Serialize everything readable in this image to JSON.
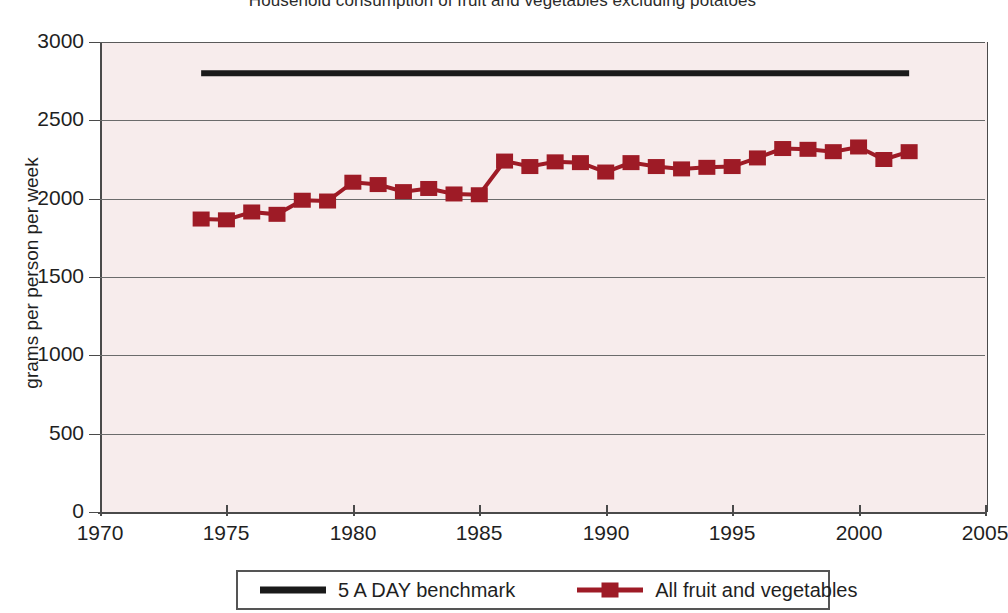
{
  "chart_data": {
    "type": "line",
    "title": "Household consumption of fruit and vegetables excluding potatoes",
    "xlabel": "",
    "ylabel": "grams per person per week",
    "xlim": [
      1970,
      2005
    ],
    "ylim": [
      0,
      3000
    ],
    "xticks": [
      1970,
      1975,
      1980,
      1985,
      1990,
      1995,
      2000,
      2005
    ],
    "xtick_labels": [
      "1970",
      "1975",
      "1980",
      "1985",
      "1990",
      "1995",
      "2000",
      "2005"
    ],
    "yticks": [
      0,
      500,
      1000,
      1500,
      2000,
      2500,
      3000
    ],
    "ytick_labels": [
      "0",
      "500",
      "1000",
      "1500",
      "2000",
      "2500",
      "3000"
    ],
    "grid": "horizontal",
    "legend_position": "bottom",
    "plot_background": "#f7ecec",
    "series": [
      {
        "name": "5 A DAY benchmark",
        "color": "#1a1a1a",
        "marker": "none",
        "line_width": 6,
        "x": [
          1974,
          2002
        ],
        "values": [
          2800,
          2800
        ]
      },
      {
        "name": "All fruit and vegetables",
        "color": "#9e1b26",
        "marker": "square",
        "line_width": 4,
        "x": [
          1974,
          1975,
          1976,
          1977,
          1978,
          1979,
          1980,
          1981,
          1982,
          1983,
          1984,
          1985,
          1986,
          1987,
          1988,
          1989,
          1990,
          1991,
          1992,
          1993,
          1994,
          1995,
          1996,
          1997,
          1998,
          1999,
          2000,
          2001,
          2002
        ],
        "values": [
          1870,
          1865,
          1915,
          1900,
          1990,
          1985,
          2105,
          2090,
          2045,
          2065,
          2030,
          2025,
          2240,
          2205,
          2235,
          2230,
          2170,
          2230,
          2205,
          2190,
          2200,
          2205,
          2260,
          2320,
          2315,
          2300,
          2330,
          2250,
          2300
        ]
      }
    ]
  },
  "legend": {
    "entries": [
      {
        "label": "5 A DAY benchmark",
        "color": "#1a1a1a",
        "marker": "none"
      },
      {
        "label": "All fruit and vegetables",
        "color": "#9e1b26",
        "marker": "square"
      }
    ]
  }
}
